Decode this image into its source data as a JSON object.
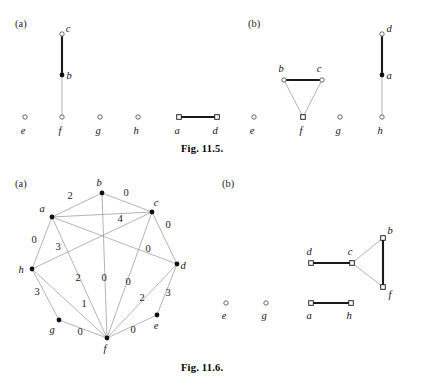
{
  "page": {
    "background_color": "#ffffff",
    "ink_color": "#111111",
    "thin_edge_color": "#8a8a8a",
    "thick_edge_color": "#1a1a1a"
  },
  "figures": [
    {
      "id": "fig-11-5",
      "caption": "Fig. 11.5.",
      "caption_pos": {
        "x": 181,
        "y": 143
      },
      "panels": [
        {
          "id": "fig115a",
          "label": "(a)",
          "label_pos": {
            "x": 15,
            "y": 18
          },
          "nodes": [
            {
              "name": "c",
              "x": 62,
              "y": 34,
              "marker": "circle",
              "label_dx": 6,
              "label_dy": -2
            },
            {
              "name": "b",
              "x": 62,
              "y": 75,
              "marker": "dot",
              "label_dx": 7,
              "label_dy": 4
            },
            {
              "name": "f",
              "x": 62,
              "y": 117,
              "marker": "circle",
              "label_dx": -2,
              "label_dy": 17
            },
            {
              "name": "e",
              "x": 25,
              "y": 117,
              "marker": "circle",
              "label_dx": -2,
              "label_dy": 17
            },
            {
              "name": "g",
              "x": 100,
              "y": 117,
              "marker": "circle",
              "label_dx": -2,
              "label_dy": 17
            },
            {
              "name": "h",
              "x": 138,
              "y": 117,
              "marker": "circle",
              "label_dx": -2,
              "label_dy": 17
            },
            {
              "name": "a",
              "x": 179,
              "y": 117,
              "marker": "square",
              "label_dx": -2,
              "label_dy": 17
            },
            {
              "name": "d",
              "x": 217,
              "y": 117,
              "marker": "square",
              "label_dx": -2,
              "label_dy": 17
            }
          ],
          "edges": [
            {
              "from": "c",
              "to": "b",
              "weight": "",
              "style": "thick"
            },
            {
              "from": "b",
              "to": "f",
              "weight": "",
              "style": "thin"
            },
            {
              "from": "a",
              "to": "d",
              "weight": "",
              "style": "thick"
            }
          ]
        },
        {
          "id": "fig115b",
          "label": "(b)",
          "label_pos": {
            "x": 248,
            "y": 18
          },
          "nodes": [
            {
              "name": "b",
              "x": 284,
              "y": 80,
              "marker": "circle",
              "label_dx": -3,
              "label_dy": -8
            },
            {
              "name": "c",
              "x": 322,
              "y": 80,
              "marker": "circle",
              "label_dx": -3,
              "label_dy": -8
            },
            {
              "name": "f",
              "x": 303,
              "y": 117,
              "marker": "square",
              "label_dx": -2,
              "label_dy": 17
            },
            {
              "name": "e",
              "x": 254,
              "y": 117,
              "marker": "circle",
              "label_dx": -2,
              "label_dy": 17
            },
            {
              "name": "g",
              "x": 340,
              "y": 117,
              "marker": "circle",
              "label_dx": -2,
              "label_dy": 17
            },
            {
              "name": "d",
              "x": 382,
              "y": 34,
              "marker": "circle",
              "label_dx": 7,
              "label_dy": -2
            },
            {
              "name": "a",
              "x": 382,
              "y": 75,
              "marker": "dot",
              "label_dx": 7,
              "label_dy": 4
            },
            {
              "name": "h",
              "x": 382,
              "y": 117,
              "marker": "circle",
              "label_dx": -2,
              "label_dy": 17
            }
          ],
          "edges": [
            {
              "from": "b",
              "to": "c",
              "weight": "",
              "style": "thick"
            },
            {
              "from": "b",
              "to": "f",
              "weight": "",
              "style": "thin"
            },
            {
              "from": "c",
              "to": "f",
              "weight": "",
              "style": "thin"
            },
            {
              "from": "d",
              "to": "a",
              "weight": "",
              "style": "thick"
            },
            {
              "from": "a",
              "to": "h",
              "weight": "",
              "style": "thin"
            }
          ]
        }
      ]
    },
    {
      "id": "fig-11-6",
      "caption": "Fig. 11.6.",
      "caption_pos": {
        "x": 181,
        "y": 362
      },
      "panels": [
        {
          "id": "fig116a",
          "label": "(a)",
          "label_pos": {
            "x": 15,
            "y": 178
          },
          "nodes": [
            {
              "name": "b",
              "x": 102,
              "y": 193,
              "marker": "dot",
              "label_dx": -3,
              "label_dy": -7
            },
            {
              "name": "c",
              "x": 152,
              "y": 212,
              "marker": "dot",
              "label_dx": 4,
              "label_dy": -6
            },
            {
              "name": "a",
              "x": 52,
              "y": 217,
              "marker": "dot",
              "label_dx": -10,
              "label_dy": -5
            },
            {
              "name": "d",
              "x": 177,
              "y": 264,
              "marker": "dot",
              "label_dx": 6,
              "label_dy": 5
            },
            {
              "name": "h",
              "x": 32,
              "y": 269,
              "marker": "dot",
              "label_dx": -11,
              "label_dy": 4
            },
            {
              "name": "g",
              "x": 59,
              "y": 320,
              "marker": "dot",
              "label_dx": -7,
              "label_dy": 13
            },
            {
              "name": "e",
              "x": 157,
              "y": 315,
              "marker": "dot",
              "label_dx": -1,
              "label_dy": 14
            },
            {
              "name": "f",
              "x": 107,
              "y": 338,
              "marker": "dot",
              "label_dx": -2,
              "label_dy": 14
            }
          ],
          "edges": [
            {
              "from": "a",
              "to": "b",
              "weight": "2",
              "wx": 70,
              "wy": 199,
              "style": "thin"
            },
            {
              "from": "b",
              "to": "c",
              "weight": "0",
              "wx": 126,
              "wy": 196,
              "style": "thin"
            },
            {
              "from": "a",
              "to": "c",
              "weight": "4",
              "wx": 120,
              "wy": 222,
              "style": "thin"
            },
            {
              "from": "a",
              "to": "h",
              "weight": "0",
              "wx": 34,
              "wy": 243,
              "style": "thin"
            },
            {
              "from": "a",
              "to": "f",
              "weight": "3",
              "wx": 58,
              "wy": 250,
              "style": "thin"
            },
            {
              "from": "c",
              "to": "d",
              "weight": "0",
              "wx": 168,
              "wy": 228,
              "style": "thin"
            },
            {
              "from": "a",
              "to": "d",
              "weight": "0",
              "wx": 148,
              "wy": 252,
              "style": "thin"
            },
            {
              "from": "h",
              "to": "c",
              "weight": "2",
              "wx": 78,
              "wy": 281,
              "style": "thin"
            },
            {
              "from": "b",
              "to": "f",
              "weight": "0",
              "wx": 104,
              "wy": 281,
              "style": "thin"
            },
            {
              "from": "c",
              "to": "f",
              "weight": "0",
              "wx": 128,
              "wy": 285,
              "style": "thin"
            },
            {
              "from": "f",
              "to": "d",
              "weight": "2",
              "wx": 142,
              "wy": 301,
              "style": "thin"
            },
            {
              "from": "e",
              "to": "d",
              "weight": "3",
              "wx": 168,
              "wy": 296,
              "style": "thin"
            },
            {
              "from": "h",
              "to": "g",
              "weight": "3",
              "wx": 37,
              "wy": 295,
              "style": "thin"
            },
            {
              "from": "h",
              "to": "f",
              "weight": "1",
              "wx": 84,
              "wy": 307,
              "style": "thin"
            },
            {
              "from": "g",
              "to": "f",
              "weight": "0",
              "wx": 80,
              "wy": 335,
              "style": "thin"
            },
            {
              "from": "f",
              "to": "e",
              "weight": "0",
              "wx": 133,
              "wy": 333,
              "style": "thin"
            }
          ]
        },
        {
          "id": "fig116b",
          "label": "(b)",
          "label_pos": {
            "x": 222,
            "y": 178
          },
          "nodes": [
            {
              "name": "b",
              "x": 383,
              "y": 238,
              "marker": "square",
              "label_dx": 7,
              "label_dy": -4
            },
            {
              "name": "d",
              "x": 311,
              "y": 263,
              "marker": "square",
              "label_dx": -2,
              "label_dy": -8
            },
            {
              "name": "c",
              "x": 352,
              "y": 263,
              "marker": "square",
              "label_dx": -2,
              "label_dy": -8
            },
            {
              "name": "f",
              "x": 383,
              "y": 287,
              "marker": "square",
              "label_dx": 7,
              "label_dy": 11
            },
            {
              "name": "e",
              "x": 226,
              "y": 303,
              "marker": "circle",
              "label_dx": -2,
              "label_dy": 16
            },
            {
              "name": "g",
              "x": 266,
              "y": 303,
              "marker": "circle",
              "label_dx": -2,
              "label_dy": 16
            },
            {
              "name": "a",
              "x": 311,
              "y": 303,
              "marker": "square",
              "label_dx": -2,
              "label_dy": 16
            },
            {
              "name": "h",
              "x": 351,
              "y": 303,
              "marker": "square",
              "label_dx": -2,
              "label_dy": 16
            }
          ],
          "edges": [
            {
              "from": "d",
              "to": "c",
              "weight": "",
              "style": "thick"
            },
            {
              "from": "c",
              "to": "b",
              "weight": "",
              "style": "thin"
            },
            {
              "from": "c",
              "to": "f",
              "weight": "",
              "style": "thin"
            },
            {
              "from": "b",
              "to": "f",
              "weight": "",
              "style": "thick"
            },
            {
              "from": "a",
              "to": "h",
              "weight": "",
              "style": "thick"
            }
          ]
        }
      ]
    }
  ]
}
